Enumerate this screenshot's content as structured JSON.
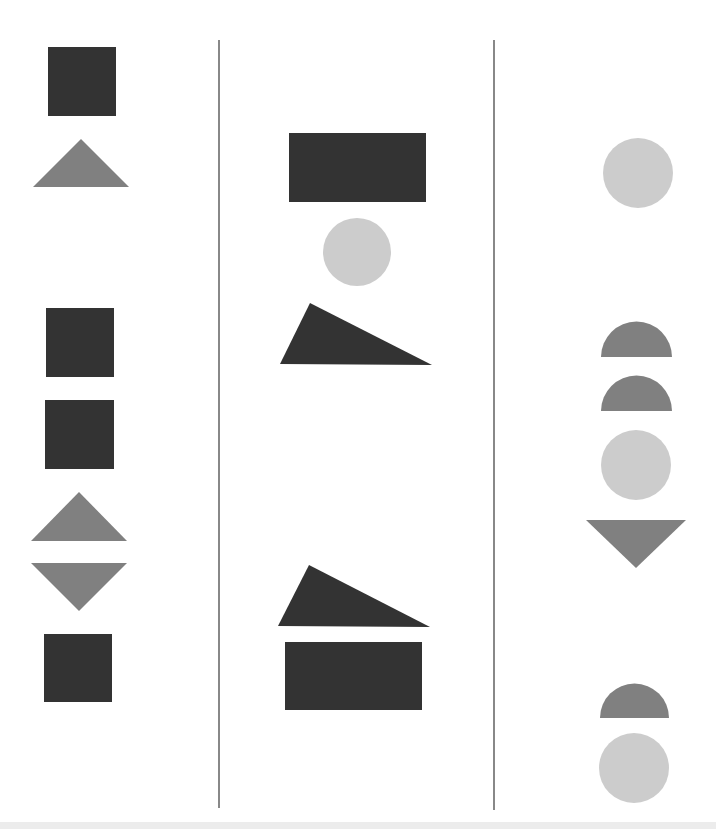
{
  "colors": {
    "dark": "#333333",
    "medium": "#808080",
    "light": "#cccccc",
    "divider": "#888888",
    "background": "#ffffff"
  },
  "dividers": [
    {
      "x": 219,
      "y1": 40,
      "y2": 808
    },
    {
      "x": 494,
      "y1": 40,
      "y2": 810
    }
  ],
  "columns": [
    {
      "name": "column-1",
      "shapes": [
        {
          "type": "square",
          "color": "dark",
          "x": 48,
          "y": 47,
          "w": 68,
          "h": 69
        },
        {
          "type": "triangle-up",
          "color": "medium",
          "points": "33,187 81,139 129,187"
        },
        {
          "type": "square",
          "color": "dark",
          "x": 46,
          "y": 308,
          "w": 68,
          "h": 69
        },
        {
          "type": "square",
          "color": "dark",
          "x": 45,
          "y": 400,
          "w": 69,
          "h": 69
        },
        {
          "type": "triangle-up",
          "color": "medium",
          "points": "31,541 79,492 127,541"
        },
        {
          "type": "triangle-down",
          "color": "medium",
          "points": "31,563 127,563 79,611"
        },
        {
          "type": "square",
          "color": "dark",
          "x": 44,
          "y": 634,
          "w": 68,
          "h": 68
        }
      ]
    },
    {
      "name": "column-2",
      "shapes": [
        {
          "type": "rectangle",
          "color": "dark",
          "x": 289,
          "y": 133,
          "w": 137,
          "h": 69
        },
        {
          "type": "circle",
          "color": "light",
          "cx": 357,
          "cy": 252,
          "r": 34
        },
        {
          "type": "right-triangle",
          "color": "dark",
          "points": "310,303 280,364 432,365"
        },
        {
          "type": "right-triangle",
          "color": "dark",
          "points": "309,565 278,626 430,627"
        },
        {
          "type": "rectangle",
          "color": "dark",
          "x": 285,
          "y": 642,
          "w": 137,
          "h": 68
        }
      ]
    },
    {
      "name": "column-3",
      "shapes": [
        {
          "type": "circle",
          "color": "light",
          "cx": 638,
          "cy": 173,
          "r": 35
        },
        {
          "type": "half-circle",
          "color": "medium",
          "cx": 636.5,
          "cy": 357,
          "r": 35.5
        },
        {
          "type": "half-circle",
          "color": "medium",
          "cx": 636.5,
          "cy": 411,
          "r": 35.5
        },
        {
          "type": "circle",
          "color": "light",
          "cx": 636,
          "cy": 465,
          "r": 35
        },
        {
          "type": "triangle-down",
          "color": "medium",
          "points": "586,520 686,520 636,568"
        },
        {
          "type": "half-circle",
          "color": "medium",
          "cx": 634.5,
          "cy": 718,
          "r": 34.5
        },
        {
          "type": "circle",
          "color": "light",
          "cx": 634,
          "cy": 768,
          "r": 35
        }
      ]
    }
  ]
}
